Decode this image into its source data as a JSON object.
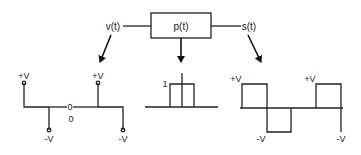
{
  "diagram": {
    "block": {
      "label": "p(t)"
    },
    "inputs": {
      "left_signal": "v(t)",
      "right_signal": "s(t)"
    },
    "panels": {
      "v": {
        "labels": {
          "left_pos": "+V",
          "left_neg": "-V",
          "zero_mark": "0",
          "zero_label": "0",
          "right_pos": "+V",
          "right_neg": "-V"
        }
      },
      "p": {
        "labels": {
          "amplitude": "1"
        }
      },
      "s": {
        "labels": {
          "pos1": "+V",
          "neg1": "-V",
          "pos2": "+V",
          "neg2": "-V"
        }
      }
    },
    "colors": {
      "line": "#222222",
      "background": "#ffffff"
    }
  }
}
